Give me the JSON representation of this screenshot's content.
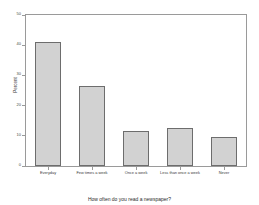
{
  "chart_data": {
    "type": "bar",
    "title": "",
    "xlabel": "How often do you read a newspaper?",
    "ylabel": "Percent",
    "categories": [
      "Everyday",
      "Few times a week",
      "Once a week",
      "Less than once a week",
      "Never"
    ],
    "values": [
      41,
      26.5,
      11.5,
      12.5,
      9.5
    ],
    "ylim": [
      0,
      50
    ],
    "yticks": [
      0,
      10,
      20,
      30,
      40,
      50
    ],
    "ytick_labels": [
      "0",
      "10",
      "20",
      "30",
      "40",
      "50"
    ],
    "grid": false,
    "legend": false,
    "bar_fill_color": "#d2d2d2",
    "bar_edge_color": "#6d6d6d",
    "axis_color": "#9a9a9a"
  }
}
